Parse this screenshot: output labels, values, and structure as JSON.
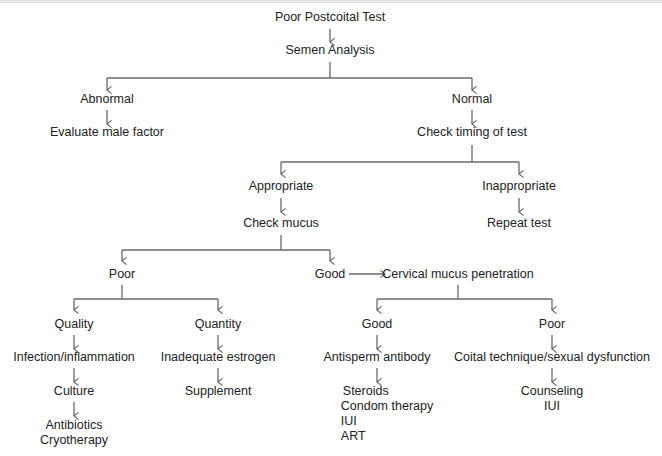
{
  "diagram": {
    "line_color": "#6a6a6a",
    "nodes": {
      "root": "Poor Postcoital Test",
      "semen_analysis": "Semen Analysis",
      "abnormal": "Abnormal",
      "evaluate_male": "Evaluate male factor",
      "normal": "Normal",
      "check_timing": "Check timing of test",
      "appropriate": "Appropriate",
      "inappropriate": "Inappropriate",
      "repeat_test": "Repeat test",
      "check_mucus": "Check mucus",
      "poor_mucus": "Poor",
      "good_mucus": "Good",
      "cervical_penetration": "Cervical mucus penetration",
      "quality": "Quality",
      "quantity": "Quantity",
      "infection": "Infection/inflammation",
      "inadequate_estrogen": "Inadequate estrogen",
      "culture": "Culture",
      "supplement": "Supplement",
      "treat_infection": [
        "Antibiotics",
        "Cryotherapy"
      ],
      "good_penetration": "Good",
      "poor_penetration": "Poor",
      "antisperm": "Antisperm antibody",
      "coital": "Coital technique/sexual dysfunction",
      "antisperm_treatments": [
        "Steroids",
        "Condom therapy",
        "IUI",
        "ART"
      ],
      "coital_treatments": [
        "Counseling",
        "IUI"
      ]
    }
  }
}
